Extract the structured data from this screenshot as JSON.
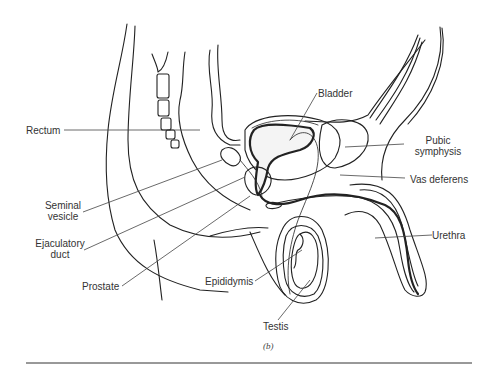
{
  "figure": {
    "caption": "(b)",
    "labels": {
      "bladder": "Bladder",
      "rectum": "Rectum",
      "pubic_symphysis_1": "Pubic",
      "pubic_symphysis_2": "symphysis",
      "seminal_vesicle_1": "Seminal",
      "seminal_vesicle_2": "vesicle",
      "vas_deferens": "Vas deferens",
      "ejaculatory_duct_1": "Ejaculatory",
      "ejaculatory_duct_2": "duct",
      "urethra": "Urethra",
      "prostate": "Prostate",
      "epididymis": "Epididymis",
      "testis": "Testis"
    }
  }
}
